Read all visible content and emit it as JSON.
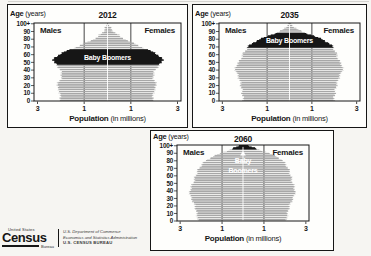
{
  "page": {
    "background": "#f6f5f2",
    "panel_background": "#fefefc",
    "ink_color": "#161616",
    "bar_color": "#a7a7a7",
    "highlight_color": "#161616"
  },
  "chart_data": [
    {
      "type": "area",
      "subtype": "population-pyramid",
      "title": "2012",
      "age_axis_label_bold": "Age",
      "age_axis_label_rest": " (years)",
      "x_axis_label_bold": "Population",
      "x_axis_label_rest": " (in millions)",
      "left_group": "Males",
      "right_group": "Females",
      "units": "millions of people per single year of age, per sex",
      "xlim": 3.15,
      "x_tick_values": [
        -3,
        -1,
        1,
        3
      ],
      "x_tick_labels": [
        "3",
        "1",
        "1",
        "3"
      ],
      "gridline_values": [
        -1,
        1
      ],
      "age_tick_labels": [
        "100+",
        "90",
        "80",
        "70",
        "60",
        "50",
        "40",
        "30",
        "20",
        "10",
        "0"
      ],
      "highlight": {
        "label": "Baby Boomers",
        "ages": [
          47,
          67
        ],
        "label_age": 56,
        "style": "on-band",
        "label_color": "#ffffff"
      },
      "colors": {
        "bars": "#a7a7a7",
        "highlight": "#161616"
      },
      "profile": {
        "ages": [
          0,
          5,
          10,
          15,
          20,
          25,
          30,
          35,
          40,
          45,
          47,
          50,
          53,
          57,
          61,
          65,
          67,
          70,
          75,
          80,
          85,
          90,
          95,
          100,
          101
        ],
        "male": [
          2.0,
          2.02,
          2.06,
          2.1,
          2.16,
          2.08,
          1.98,
          1.96,
          2.04,
          2.12,
          2.18,
          2.28,
          2.32,
          2.22,
          2.02,
          1.72,
          1.55,
          1.32,
          0.95,
          0.6,
          0.34,
          0.16,
          0.07,
          0.02,
          0.02
        ],
        "female": [
          1.92,
          1.94,
          1.98,
          2.03,
          2.09,
          2.03,
          1.96,
          1.96,
          2.06,
          2.16,
          2.22,
          2.32,
          2.36,
          2.27,
          2.09,
          1.82,
          1.66,
          1.44,
          1.1,
          0.76,
          0.47,
          0.25,
          0.11,
          0.03,
          0.03
        ]
      }
    },
    {
      "type": "area",
      "subtype": "population-pyramid",
      "title": "2035",
      "age_axis_label_bold": "Age",
      "age_axis_label_rest": " (years)",
      "x_axis_label_bold": "Population",
      "x_axis_label_rest": " (in millions)",
      "left_group": "Males",
      "right_group": "Females",
      "units": "millions of people per single year of age, per sex",
      "xlim": 3.15,
      "x_tick_values": [
        -3,
        -1,
        1,
        3
      ],
      "x_tick_labels": [
        "3",
        "1",
        "1",
        "3"
      ],
      "gridline_values": [
        -1,
        1
      ],
      "age_tick_labels": [
        "100+",
        "90",
        "80",
        "70",
        "60",
        "50",
        "40",
        "30",
        "20",
        "10",
        "0"
      ],
      "highlight": {
        "label": "Baby Boomers",
        "ages": [
          69,
          88
        ],
        "label_age": 78,
        "style": "on-band",
        "label_color": "#ffffff"
      },
      "colors": {
        "bars": "#a7a7a7",
        "highlight": "#161616"
      },
      "profile": {
        "ages": [
          0,
          5,
          10,
          15,
          20,
          25,
          30,
          35,
          40,
          43,
          47,
          50,
          55,
          60,
          65,
          69,
          72,
          75,
          80,
          84,
          88,
          92,
          96,
          100,
          101
        ],
        "male": [
          2.06,
          2.08,
          2.11,
          2.14,
          2.17,
          2.2,
          2.26,
          2.33,
          2.42,
          2.44,
          2.34,
          2.26,
          2.17,
          2.09,
          1.99,
          1.88,
          1.78,
          1.64,
          1.32,
          0.98,
          0.58,
          0.32,
          0.13,
          0.04,
          0.03
        ],
        "female": [
          1.98,
          2.0,
          2.03,
          2.06,
          2.1,
          2.14,
          2.2,
          2.28,
          2.37,
          2.4,
          2.32,
          2.25,
          2.17,
          2.11,
          2.04,
          1.95,
          1.87,
          1.74,
          1.45,
          1.12,
          0.7,
          0.42,
          0.18,
          0.06,
          0.04
        ]
      }
    },
    {
      "type": "area",
      "subtype": "population-pyramid",
      "title": "2060",
      "age_axis_label_bold": "Age",
      "age_axis_label_rest": " (years)",
      "x_axis_label_bold": "Population",
      "x_axis_label_rest": " (in millions)",
      "left_group": "Males",
      "right_group": "Females",
      "units": "millions of people per single year of age, per sex",
      "xlim": 3.15,
      "x_tick_values": [
        -3,
        -1,
        1,
        3
      ],
      "x_tick_labels": [
        "3",
        "1",
        "1",
        "3"
      ],
      "gridline_values": [
        -1,
        1
      ],
      "age_tick_labels": [
        "100+",
        "90",
        "80",
        "70",
        "60",
        "50",
        "40",
        "30",
        "20",
        "10",
        "0"
      ],
      "highlight": {
        "label": "Baby Boomers",
        "ages": [
          95,
          101
        ],
        "style": "arrow",
        "label_lines": [
          "Baby",
          "Boomers"
        ],
        "label_ages": [
          77,
          64
        ],
        "arrow_tip_age": 93,
        "label_color": "#ffffff"
      },
      "colors": {
        "bars": "#a7a7a7",
        "highlight": "#161616"
      },
      "profile": {
        "ages": [
          0,
          5,
          10,
          15,
          20,
          25,
          30,
          35,
          40,
          45,
          50,
          55,
          60,
          65,
          70,
          75,
          80,
          85,
          90,
          95,
          97,
          100,
          101
        ],
        "male": [
          2.16,
          2.18,
          2.21,
          2.24,
          2.29,
          2.37,
          2.47,
          2.54,
          2.54,
          2.47,
          2.39,
          2.32,
          2.27,
          2.19,
          2.09,
          1.96,
          1.78,
          1.5,
          1.08,
          0.58,
          0.44,
          0.15,
          0.1
        ],
        "female": [
          2.08,
          2.1,
          2.13,
          2.16,
          2.21,
          2.29,
          2.39,
          2.47,
          2.49,
          2.44,
          2.38,
          2.32,
          2.29,
          2.23,
          2.15,
          2.04,
          1.9,
          1.66,
          1.26,
          0.72,
          0.56,
          0.22,
          0.15
        ]
      }
    }
  ],
  "footer": {
    "logo": {
      "top": "United States",
      "main": "Census",
      "sub": "Bureau"
    },
    "agency_lines": [
      "U.S. Department of Commerce",
      "Economics and Statistics Administration",
      "U.S. CENSUS BUREAU"
    ]
  }
}
